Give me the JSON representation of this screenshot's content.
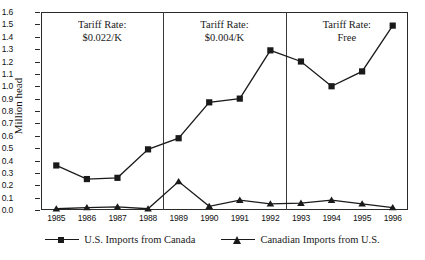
{
  "chart_data": {
    "type": "line",
    "title": "",
    "xlabel": "",
    "ylabel": "Million head",
    "ylim": [
      0.0,
      1.6
    ],
    "ytick_step": 0.1,
    "grid": false,
    "legend_position": "bottom",
    "categories": [
      "1985",
      "1986",
      "1987",
      "1988",
      "1989",
      "1990",
      "1991",
      "1992",
      "1993",
      "1994",
      "1995",
      "1996"
    ],
    "series": [
      {
        "name": "U.S. Imports from Canada",
        "marker": "square",
        "values": [
          0.36,
          0.25,
          0.26,
          0.49,
          0.58,
          0.87,
          0.9,
          1.29,
          1.2,
          1.0,
          1.12,
          1.49
        ]
      },
      {
        "name": "Canadian Imports from U.S.",
        "marker": "triangle",
        "values": [
          0.01,
          0.02,
          0.025,
          0.01,
          0.23,
          0.03,
          0.08,
          0.05,
          0.055,
          0.08,
          0.05,
          0.02
        ]
      }
    ],
    "yticks": [
      "0.0",
      "0.1",
      "0.2",
      "0.3",
      "0.4",
      "0.5",
      "0.6",
      "0.7",
      "0.8",
      "0.9",
      "1.0",
      "1.1",
      "1.2",
      "1.3",
      "1.4",
      "1.5",
      "1.6"
    ],
    "annotations": [
      {
        "line1": "Tariff Rate:",
        "line2": "$0.022/K",
        "span_start": "1985",
        "span_end": "1988"
      },
      {
        "line1": "Tariff Rate:",
        "line2": "$0.004/K",
        "span_start": "1989",
        "span_end": "1992"
      },
      {
        "line1": "Tariff Rate:",
        "line2": "Free",
        "span_start": "1993",
        "span_end": "1996"
      }
    ],
    "dividers": [
      3.5,
      7.5
    ],
    "colors": {
      "line": "#1a1a1a",
      "axis": "#2a2a2a",
      "divider": "#3a3a3a",
      "text": "#1a1a1a"
    }
  }
}
